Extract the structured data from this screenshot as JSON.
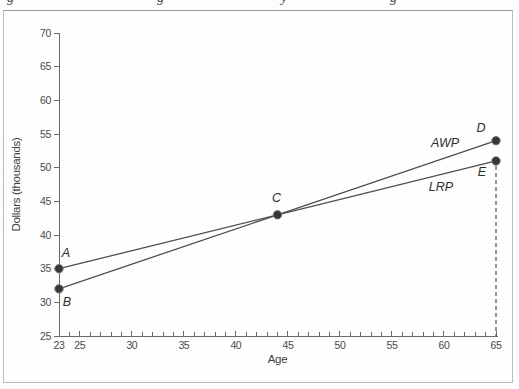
{
  "chart_data": {
    "type": "line",
    "title": "",
    "xlabel": "Age",
    "ylabel": "Dollars (thousands)",
    "xlim": [
      23,
      65
    ],
    "ylim": [
      25,
      70
    ],
    "x_major_ticks": [
      23,
      25,
      30,
      35,
      40,
      45,
      50,
      55,
      60,
      65
    ],
    "x_minor_tick_step": 1,
    "y_ticks": [
      25,
      30,
      35,
      40,
      45,
      50,
      55,
      60,
      65,
      70
    ],
    "grid": false,
    "legend": "inline-labels",
    "series": [
      {
        "name": "AWP",
        "points": [
          [
            23,
            32
          ],
          [
            44,
            43
          ],
          [
            65,
            54
          ]
        ],
        "label_at": [
          60.1,
          53.1
        ]
      },
      {
        "name": "LRP",
        "points": [
          [
            23,
            35
          ],
          [
            44,
            43
          ],
          [
            65,
            51
          ]
        ],
        "label_at": [
          59.7,
          46.5
        ]
      }
    ],
    "point_markers": [
      {
        "label": "A",
        "x": 23,
        "y": 35,
        "label_dx": 7,
        "label_dy": -12
      },
      {
        "label": "B",
        "x": 23,
        "y": 32,
        "label_dx": 8,
        "label_dy": 17
      },
      {
        "label": "C",
        "x": 44,
        "y": 43,
        "label_dx": -1,
        "label_dy": -13
      },
      {
        "label": "D",
        "x": 65,
        "y": 54,
        "label_dx": -15,
        "label_dy": -9
      },
      {
        "label": "E",
        "x": 65,
        "y": 51,
        "label_dx": -14,
        "label_dy": 15
      }
    ],
    "dashed_line": {
      "x": 65,
      "from_y": 51,
      "to_y": 25
    }
  },
  "cropped_caption": {
    "fragments": [
      {
        "glyph": "g",
        "x": 7
      },
      {
        "glyph": "g",
        "x": 157
      },
      {
        "glyph": "y",
        "x": 281
      },
      {
        "glyph": "g",
        "x": 390
      }
    ]
  }
}
